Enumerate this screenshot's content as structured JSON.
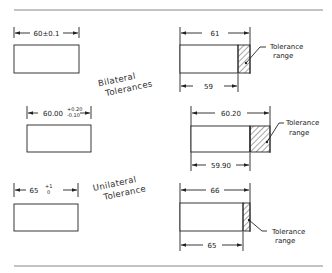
{
  "diagram": {
    "groups": {
      "bilateral_label": [
        "Bilateral",
        "Tolerances"
      ],
      "unilateral_label": [
        "Unilateral",
        "Tolerance"
      ]
    },
    "rows": [
      {
        "left": {
          "dimension": "60±0.1"
        },
        "right": {
          "max_dim": "61",
          "min_dim": "59",
          "callout": [
            "Tolerance",
            "range"
          ]
        }
      },
      {
        "left": {
          "nominal": "60.00",
          "upper": "+0.20",
          "lower": "-0.10"
        },
        "right": {
          "max_dim": "60.20",
          "min_dim": "59.90",
          "callout": [
            "Tolerance",
            "range"
          ]
        }
      },
      {
        "left": {
          "nominal": "65",
          "upper": "+1",
          "lower": "0"
        },
        "right": {
          "max_dim": "66",
          "min_dim": "65",
          "callout": [
            "Tolerance",
            "range"
          ]
        }
      }
    ],
    "colors": {
      "line": "#222222",
      "rule": "#888888",
      "background": "#ffffff"
    }
  }
}
